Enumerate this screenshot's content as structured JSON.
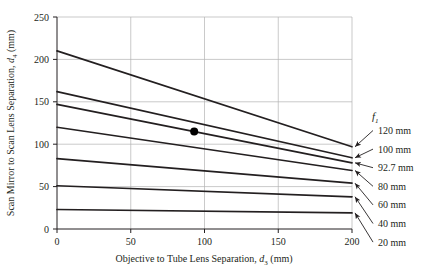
{
  "chart_data": {
    "type": "line",
    "title": "",
    "subtitle": "",
    "xlabel_text": "Objective to Tube Lens Separation, ",
    "xlabel_sym": "d",
    "xlabel_sub": "3",
    "xlabel_unit": " (mm)",
    "xlabel": "Objective to Tube Lens Separation, d3 (mm)",
    "ylabel_text": "Scan Mirror to Scan Lens Separation, ",
    "ylabel_sym": "d",
    "ylabel_sub": "4",
    "ylabel_unit": " (mm)",
    "ylabel": "Scan Mirror to Scan Lens Separation, d4 (mm)",
    "xlim": [
      0,
      200
    ],
    "ylim": [
      0,
      250
    ],
    "xticks": [
      0,
      50,
      100,
      150,
      200
    ],
    "xtick_labels": [
      "0",
      "50",
      "100",
      "150",
      "200"
    ],
    "yticks": [
      0,
      50,
      100,
      150,
      200,
      250
    ],
    "ytick_labels": [
      "0",
      "50",
      "100",
      "150",
      "200",
      "250"
    ],
    "grid": true,
    "grid_color": "#b3b3b3",
    "line_color": "#231f20",
    "legend_position": "right-outside",
    "legend_title_sym": "f",
    "legend_title_sub": "1",
    "legend_title": "f1",
    "x": [
      0,
      200
    ],
    "series": [
      {
        "name": "120 mm",
        "label": "120 mm",
        "values": [
          210,
          97
        ]
      },
      {
        "name": "100 mm",
        "label": "100 mm",
        "values": [
          162,
          84
        ]
      },
      {
        "name": "92.7 mm",
        "label": "92.7 mm",
        "values": [
          147,
          78
        ]
      },
      {
        "name": "80 mm",
        "label": "80 mm",
        "values": [
          120,
          69
        ]
      },
      {
        "name": "60 mm",
        "label": "60 mm",
        "values": [
          83,
          54
        ]
      },
      {
        "name": "40 mm",
        "label": "40 mm",
        "values": [
          51,
          38
        ]
      },
      {
        "name": "20 mm",
        "label": "20 mm",
        "values": [
          23,
          19
        ]
      }
    ],
    "markers": [
      {
        "name": "design-point",
        "x": 93,
        "y": 115,
        "color": "#000000",
        "radius": 4
      }
    ]
  }
}
